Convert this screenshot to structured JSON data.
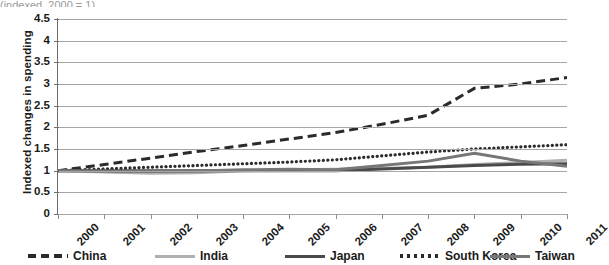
{
  "title_sliver": "(indexed, 2000 = 1)",
  "chart_data": {
    "type": "line",
    "title": "",
    "xlabel": "",
    "ylabel": "Indexed changes in spending",
    "grid": true,
    "legend_position": "bottom",
    "x": [
      2000,
      2001,
      2002,
      2003,
      2004,
      2005,
      2006,
      2007,
      2008,
      2009,
      2010,
      2011
    ],
    "xtick_labels": [
      "2000",
      "2001",
      "2002",
      "2003",
      "2004",
      "2005",
      "2006",
      "2007",
      "2008",
      "2009",
      "2010",
      "2011"
    ],
    "ytick_labels": [
      "0",
      "0.5",
      "1",
      "1.5",
      "2",
      "2.5",
      "3",
      "3.5",
      "4",
      "4.5"
    ],
    "ytick_values": [
      0,
      0.5,
      1,
      1.5,
      2,
      2.5,
      3,
      3.5,
      4,
      4.5
    ],
    "ylim": [
      0,
      4.5
    ],
    "xlim": [
      2000,
      2011
    ],
    "series": [
      {
        "name": "China",
        "style": "dashed",
        "color": "#2b2b2b",
        "values": [
          1.0,
          1.14,
          1.29,
          1.44,
          1.58,
          1.73,
          1.88,
          2.07,
          2.28,
          2.9,
          3.0,
          3.15
        ]
      },
      {
        "name": "India",
        "style": "solid",
        "color": "#b0b0b0",
        "values": [
          1.0,
          0.97,
          0.94,
          0.95,
          1.0,
          1.02,
          1.03,
          1.05,
          1.08,
          1.14,
          1.19,
          1.24
        ]
      },
      {
        "name": "Japan",
        "style": "solid",
        "color": "#4a4a4a",
        "values": [
          1.0,
          1.0,
          1.0,
          1.0,
          1.0,
          1.0,
          1.0,
          1.04,
          1.08,
          1.12,
          1.15,
          1.16
        ]
      },
      {
        "name": "South Korea",
        "style": "dotted",
        "color": "#2b2b2b",
        "values": [
          1.0,
          1.04,
          1.08,
          1.12,
          1.16,
          1.2,
          1.25,
          1.34,
          1.43,
          1.5,
          1.55,
          1.6
        ]
      },
      {
        "name": "Taiwan",
        "style": "solid",
        "color": "#777777",
        "values": [
          1.0,
          0.99,
          0.98,
          0.99,
          1.02,
          1.03,
          1.02,
          1.12,
          1.22,
          1.4,
          1.22,
          1.1
        ]
      }
    ]
  },
  "legend": {
    "items": [
      {
        "label": "China",
        "style": "dashed",
        "color": "#2b2b2b"
      },
      {
        "label": "India",
        "style": "solid",
        "color": "#b0b0b0"
      },
      {
        "label": "Japan",
        "style": "solid",
        "color": "#4a4a4a"
      },
      {
        "label": "South Korea",
        "style": "dotted",
        "color": "#2b2b2b"
      },
      {
        "label": "Taiwan",
        "style": "solid",
        "color": "#777777"
      }
    ]
  }
}
